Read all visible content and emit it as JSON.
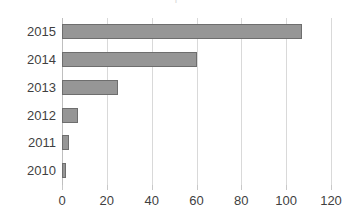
{
  "chart_data": {
    "type": "bar",
    "orientation": "horizontal",
    "title": "",
    "xlabel": "",
    "ylabel": "",
    "categories": [
      "2015",
      "2014",
      "2013",
      "2012",
      "2011",
      "2010"
    ],
    "values": [
      107,
      60,
      25,
      7,
      3,
      2
    ],
    "series": [
      {
        "name": "Series 1",
        "values": [
          107,
          60,
          25,
          7,
          3,
          2
        ]
      }
    ],
    "xlim": [
      0,
      120
    ],
    "xticks": [
      0,
      20,
      40,
      60,
      80,
      100,
      120
    ],
    "xtick_labels": [
      "0",
      "20",
      "40",
      "60",
      "80",
      "100",
      "120"
    ],
    "grid": true,
    "grid_axis": "x",
    "legend": false,
    "legend_position": "none",
    "bar_color": "#969696",
    "bar_border_color": "#6e6e6e",
    "gridline_color": "#d9d9d9",
    "axis_color": "#bfbfbf",
    "tick_label_color": "#3f3f3f",
    "background_color": "#ffffff"
  },
  "annotations": {
    "title_remnant": "|"
  }
}
